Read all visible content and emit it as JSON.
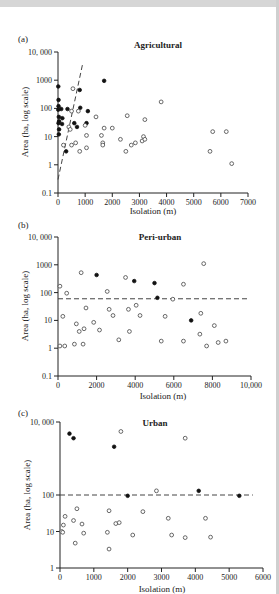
{
  "chart_data": [
    {
      "panel": "(a)",
      "type": "scatter",
      "title": "Agricultural",
      "xlabel": "Isolation (m)",
      "ylabel": "Area (ha, log scale)",
      "xlim": [
        0,
        7000
      ],
      "ylim": [
        0.1,
        10000
      ],
      "yscale": "log",
      "xticks": [
        0,
        1000,
        2000,
        3000,
        4000,
        5000,
        6000,
        7000
      ],
      "xtick_labels": [
        "0",
        "1000",
        "2000",
        "3000",
        "4000",
        "5000",
        "6000",
        "7000"
      ],
      "yticks": [
        0.1,
        1,
        10,
        100,
        1000,
        10000
      ],
      "ytick_labels": [
        "0.1",
        "1",
        "10",
        "100",
        "1000",
        "10, 000"
      ],
      "reference_line": {
        "style": "dashed",
        "x": [
          0,
          900
        ],
        "y": [
          0.3,
          3500
        ]
      },
      "series": [
        {
          "name": "filled",
          "marker": "filled-circle",
          "points": [
            [
              10,
              600
            ],
            [
              20,
              200
            ],
            [
              20,
              120
            ],
            [
              10,
              90
            ],
            [
              30,
              50
            ],
            [
              40,
              35
            ],
            [
              20,
              30
            ],
            [
              40,
              18
            ],
            [
              30,
              12
            ],
            [
              120,
              95
            ],
            [
              160,
              45
            ],
            [
              150,
              28
            ],
            [
              350,
              95
            ],
            [
              300,
              3
            ],
            [
              600,
              30
            ],
            [
              700,
              22
            ],
            [
              800,
              450
            ],
            [
              820,
              105
            ],
            [
              1100,
              80
            ],
            [
              1050,
              30
            ],
            [
              1700,
              950
            ]
          ]
        },
        {
          "name": "open",
          "marker": "open-circle",
          "points": [
            [
              200,
              5
            ],
            [
              400,
              22
            ],
            [
              450,
              18
            ],
            [
              500,
              5
            ],
            [
              500,
              80
            ],
            [
              550,
              500
            ],
            [
              650,
              6
            ],
            [
              750,
              80
            ],
            [
              800,
              3
            ],
            [
              1000,
              25
            ],
            [
              1050,
              11
            ],
            [
              1050,
              4
            ],
            [
              1400,
              50
            ],
            [
              1600,
              11
            ],
            [
              1650,
              6
            ],
            [
              1650,
              5
            ],
            [
              1700,
              20
            ],
            [
              2000,
              20
            ],
            [
              2300,
              8
            ],
            [
              2500,
              3
            ],
            [
              2550,
              55
            ],
            [
              2700,
              5
            ],
            [
              2850,
              6
            ],
            [
              3100,
              7
            ],
            [
              3150,
              10
            ],
            [
              3200,
              8
            ],
            [
              3200,
              40
            ],
            [
              3800,
              170
            ],
            [
              5600,
              3
            ],
            [
              5700,
              15
            ],
            [
              6200,
              15
            ],
            [
              6400,
              1.1
            ]
          ]
        }
      ]
    },
    {
      "panel": "(b)",
      "type": "scatter",
      "title": "Peri-urban",
      "xlabel": "Isolation (m)",
      "ylabel": "Area (ha, log scale)",
      "xlim": [
        0,
        10000
      ],
      "ylim": [
        0.1,
        10000
      ],
      "yscale": "log",
      "xticks": [
        0,
        2000,
        4000,
        6000,
        8000,
        10000
      ],
      "xtick_labels": [
        "0",
        "2000",
        "4000",
        "6000",
        "8000",
        "10,000"
      ],
      "yticks": [
        0.1,
        1,
        10,
        100,
        1000,
        10000
      ],
      "ytick_labels": [
        "0.1",
        "1",
        "10",
        "100",
        "1000",
        "10, 000"
      ],
      "reference_line": {
        "style": "dashed",
        "y": 60,
        "x": [
          0,
          9800
        ]
      },
      "series": [
        {
          "name": "filled",
          "marker": "filled-circle",
          "points": [
            [
              2000,
              430
            ],
            [
              3950,
              260
            ],
            [
              5000,
              220
            ],
            [
              5150,
              65
            ],
            [
              6900,
              10
            ]
          ]
        },
        {
          "name": "open",
          "marker": "open-circle",
          "points": [
            [
              100,
              170
            ],
            [
              100,
              1.2
            ],
            [
              250,
              14
            ],
            [
              350,
              1.2
            ],
            [
              450,
              95
            ],
            [
              850,
              1.4
            ],
            [
              950,
              7.5
            ],
            [
              1100,
              4
            ],
            [
              1200,
              520
            ],
            [
              1300,
              1.4
            ],
            [
              1350,
              5
            ],
            [
              1450,
              28
            ],
            [
              1850,
              8.5
            ],
            [
              2150,
              4.5
            ],
            [
              2550,
              110
            ],
            [
              2650,
              25
            ],
            [
              2850,
              15
            ],
            [
              3150,
              2
            ],
            [
              3500,
              350
            ],
            [
              3650,
              25
            ],
            [
              3700,
              4
            ],
            [
              4050,
              35
            ],
            [
              4250,
              15
            ],
            [
              5350,
              1.8
            ],
            [
              5550,
              14
            ],
            [
              5950,
              58
            ],
            [
              6500,
              200
            ],
            [
              6500,
              1.8
            ],
            [
              7350,
              3.2
            ],
            [
              7400,
              18
            ],
            [
              7550,
              1100
            ],
            [
              7700,
              1.2
            ],
            [
              8100,
              6.5
            ],
            [
              8300,
              1.6
            ],
            [
              8700,
              1.8
            ]
          ]
        }
      ]
    },
    {
      "panel": "(c)",
      "type": "scatter",
      "title": "Urban",
      "xlabel": "Isolation (m)",
      "ylabel": "Area (ha, log scale)",
      "xlim": [
        0,
        6000
      ],
      "ylim": [
        1,
        10000
      ],
      "yscale": "log",
      "xticks": [
        0,
        1000,
        2000,
        3000,
        4000,
        5000,
        6000
      ],
      "xtick_labels": [
        "0",
        "1000",
        "2000",
        "3000",
        "4000",
        "5000",
        "6000"
      ],
      "yticks": [
        1,
        10,
        100,
        10000
      ],
      "ytick_labels": [
        "1",
        "10",
        "100",
        "10, 000"
      ],
      "reference_line": {
        "style": "dashed",
        "y": 100,
        "x": [
          0,
          5700
        ]
      },
      "series": [
        {
          "name": "filled",
          "marker": "filled-circle",
          "points": [
            [
              280,
              4800
            ],
            [
              400,
              3600
            ],
            [
              1600,
              2100
            ],
            [
              2000,
              95
            ],
            [
              4100,
              130
            ],
            [
              5300,
              95
            ]
          ]
        },
        {
          "name": "open",
          "marker": "open-circle",
          "points": [
            [
              50,
              10
            ],
            [
              80,
              9.5
            ],
            [
              100,
              15
            ],
            [
              150,
              26
            ],
            [
              400,
              20
            ],
            [
              450,
              4.8
            ],
            [
              500,
              42
            ],
            [
              650,
              16
            ],
            [
              700,
              9
            ],
            [
              1400,
              9.5
            ],
            [
              1450,
              37
            ],
            [
              1450,
              3.3
            ],
            [
              1650,
              16.5
            ],
            [
              1750,
              17.5
            ],
            [
              1800,
              5500
            ],
            [
              2150,
              8
            ],
            [
              2450,
              35
            ],
            [
              2850,
              130
            ],
            [
              3200,
              23
            ],
            [
              3300,
              8
            ],
            [
              3700,
              3600
            ],
            [
              3700,
              6.8
            ],
            [
              4300,
              23
            ],
            [
              4450,
              7
            ]
          ]
        }
      ]
    }
  ],
  "panels": [
    {
      "label": "(a)",
      "title": "Agricultural",
      "xlabel": "Isolation (m)",
      "ylabel": "Area (ha, log scale)"
    },
    {
      "label": "(b)",
      "title": "Peri-urban",
      "xlabel": "Isolation (m)",
      "ylabel": "Area (ha, log scale)"
    },
    {
      "label": "(c)",
      "title": "Urban",
      "xlabel": "Isolation (m)",
      "ylabel": "Area (ha, log scale)"
    }
  ]
}
